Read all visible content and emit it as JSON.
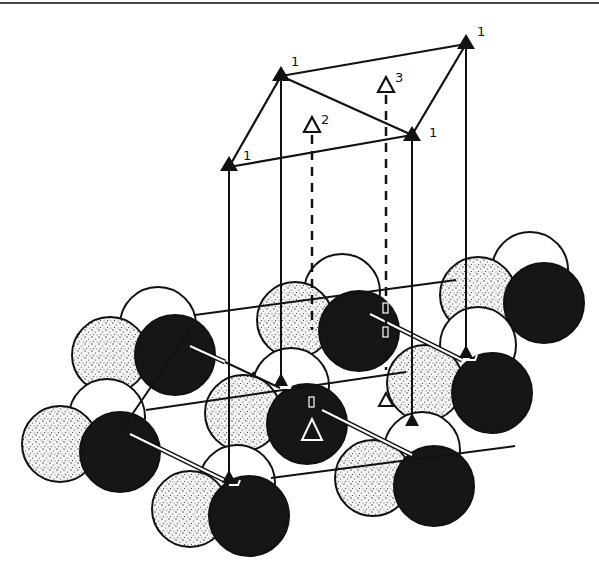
{
  "figure": {
    "site_labels": {
      "top_left": "1",
      "top_back": "1",
      "top_right_back": "1",
      "top_right_front": "1",
      "hollow_a": "2",
      "hollow_b": "3"
    },
    "colors": {
      "ink": "#111111",
      "dark_atom": "#161616",
      "stippled_atom": "#f2f2f2",
      "open_atom": "#ffffff"
    }
  }
}
